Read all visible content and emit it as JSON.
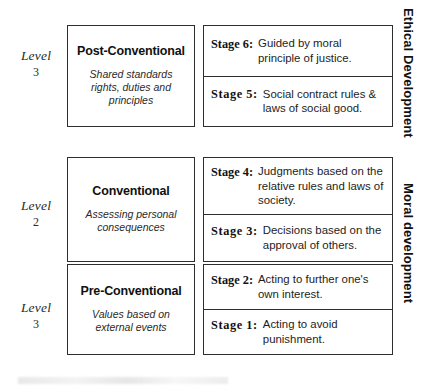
{
  "diagram": {
    "axis_labels": {
      "upper": "Ethical Development",
      "lower": "Moral development"
    },
    "rows": [
      {
        "level_word": "Level",
        "level_number": "3",
        "name": "Post-Conventional",
        "description": "Shared standards rights, duties and principles",
        "stages": [
          {
            "key": "Stage 6:",
            "text": "Guided by moral principle of justice."
          },
          {
            "key": "Stage 5:",
            "text": "Social contract rules & laws of social good."
          }
        ]
      },
      {
        "level_word": "Level",
        "level_number": "2",
        "name": "Conventional",
        "description": "Assessing personal consequences",
        "stages": [
          {
            "key": "Stage 4:",
            "text": "Judgments based on the relative rules and laws of society."
          },
          {
            "key": "Stage 3:",
            "text": "Decisions based on the approval of others."
          }
        ]
      },
      {
        "level_word": "Level",
        "level_number": "3",
        "name": "Pre-Conventional",
        "description": "Values based on external events",
        "stages": [
          {
            "key": "Stage 2:",
            "text": "Acting to further one's own interest."
          },
          {
            "key": "Stage 1:",
            "text": "Acting to avoid punishment."
          }
        ]
      }
    ],
    "colors": {
      "border": "#2e2e2e",
      "text": "#1a1a1a",
      "background": "#ffffff"
    }
  }
}
